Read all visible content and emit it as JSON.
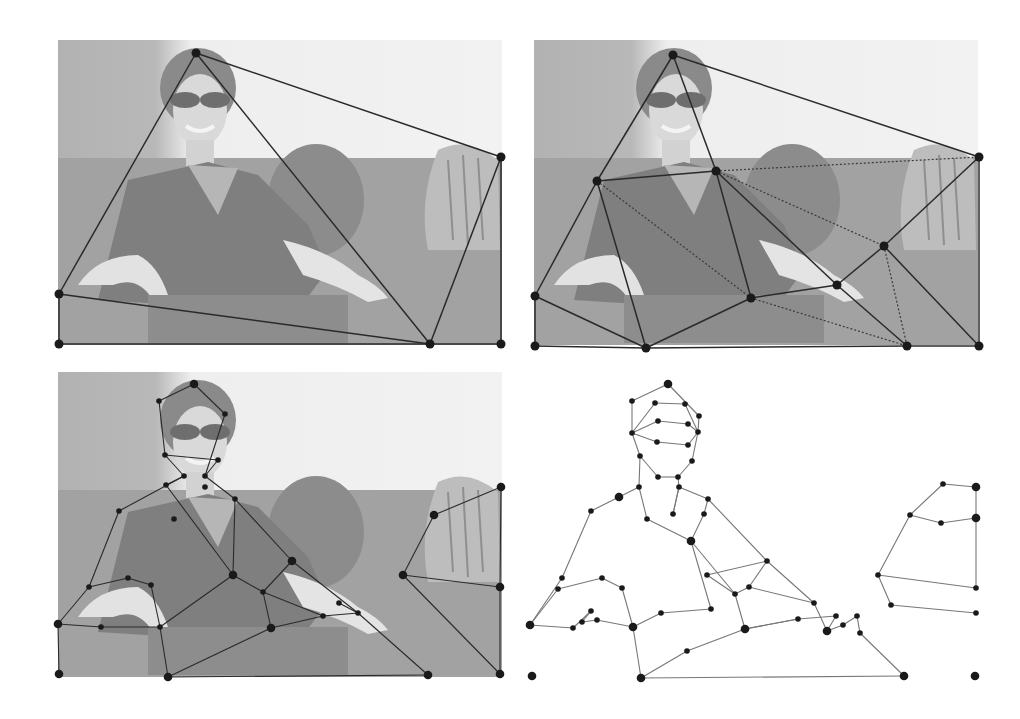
{
  "figure": {
    "colors": {
      "sky": "#efefef",
      "upper_bg": "#b9b9b9",
      "lower_bg": "#9a9a9a",
      "edge": "#2a2a2a",
      "dotted_edge": "#3a3a3a",
      "node": "#1a1a1a",
      "panel4_edge": "#777777"
    },
    "panels": [
      {
        "id": "panel-1",
        "label": "coarse-triangulation",
        "bbox": [
          58,
          40,
          502,
          345
        ],
        "nodes": [
          [
            196,
            53
          ],
          [
            501,
            157
          ],
          [
            59,
            294
          ],
          [
            59,
            344
          ],
          [
            430,
            344
          ],
          [
            501,
            344
          ]
        ],
        "edges": [
          [
            0,
            1
          ],
          [
            0,
            2
          ],
          [
            0,
            4
          ],
          [
            1,
            4
          ],
          [
            2,
            4
          ],
          [
            1,
            5
          ],
          [
            2,
            3
          ],
          [
            3,
            4
          ],
          [
            4,
            5
          ]
        ],
        "dotted_edges": []
      },
      {
        "id": "panel-2",
        "label": "refined-triangulation",
        "bbox": [
          534,
          40,
          980,
          346
        ],
        "nodes": [
          [
            673,
            55
          ],
          [
            979,
            157
          ],
          [
            597,
            181
          ],
          [
            716,
            171
          ],
          [
            535,
            296
          ],
          [
            535,
            346
          ],
          [
            646,
            348
          ],
          [
            751,
            298
          ],
          [
            837,
            285
          ],
          [
            884,
            246
          ],
          [
            907,
            346
          ],
          [
            979,
            346
          ]
        ],
        "edges": [
          [
            0,
            1
          ],
          [
            0,
            2
          ],
          [
            0,
            3
          ],
          [
            2,
            3
          ],
          [
            2,
            4
          ],
          [
            2,
            6
          ],
          [
            3,
            7
          ],
          [
            3,
            8
          ],
          [
            4,
            6
          ],
          [
            4,
            5
          ],
          [
            5,
            6
          ],
          [
            6,
            7
          ],
          [
            7,
            8
          ],
          [
            8,
            9
          ],
          [
            9,
            1
          ],
          [
            8,
            10
          ],
          [
            9,
            11
          ],
          [
            1,
            11
          ],
          [
            6,
            10
          ],
          [
            10,
            11
          ]
        ],
        "dotted_edges": [
          [
            3,
            1
          ],
          [
            2,
            7
          ],
          [
            3,
            9
          ],
          [
            7,
            10
          ],
          [
            9,
            10
          ]
        ]
      },
      {
        "id": "panel-3",
        "label": "contour-mesh-on-image",
        "bbox": [
          58,
          372,
          502,
          676
        ],
        "nodes": [
          [
            194,
            384
          ],
          [
            159,
            401
          ],
          [
            225,
            414
          ],
          [
            165,
            455
          ],
          [
            218,
            460
          ],
          [
            184,
            476
          ],
          [
            205,
            476
          ],
          [
            166,
            485
          ],
          [
            205,
            487
          ],
          [
            235,
            499
          ],
          [
            119,
            511
          ],
          [
            174,
            519
          ],
          [
            292,
            561
          ],
          [
            233,
            575
          ],
          [
            263,
            592
          ],
          [
            89,
            587
          ],
          [
            128,
            578
          ],
          [
            151,
            585
          ],
          [
            58,
            624
          ],
          [
            101,
            627
          ],
          [
            160,
            627
          ],
          [
            271,
            628
          ],
          [
            323,
            616
          ],
          [
            339,
            603
          ],
          [
            358,
            613
          ],
          [
            59,
            674
          ],
          [
            168,
            677
          ],
          [
            428,
            675
          ],
          [
            501,
            487
          ],
          [
            434,
            515
          ],
          [
            403,
            575
          ],
          [
            500,
            587
          ],
          [
            500,
            674
          ]
        ],
        "edges": [
          [
            0,
            1
          ],
          [
            0,
            2
          ],
          [
            1,
            3
          ],
          [
            2,
            6
          ],
          [
            3,
            4
          ],
          [
            4,
            6
          ],
          [
            3,
            5
          ],
          [
            5,
            7
          ],
          [
            5,
            10
          ],
          [
            6,
            9
          ],
          [
            7,
            13
          ],
          [
            9,
            13
          ],
          [
            9,
            12
          ],
          [
            10,
            15
          ],
          [
            15,
            18
          ],
          [
            12,
            24
          ],
          [
            13,
            14
          ],
          [
            14,
            22
          ],
          [
            13,
            20
          ],
          [
            16,
            17
          ],
          [
            15,
            16
          ],
          [
            17,
            20
          ],
          [
            18,
            19
          ],
          [
            19,
            20
          ],
          [
            20,
            26
          ],
          [
            21,
            22
          ],
          [
            14,
            21
          ],
          [
            12,
            14
          ],
          [
            22,
            24
          ],
          [
            23,
            24
          ],
          [
            21,
            26
          ],
          [
            24,
            27
          ],
          [
            26,
            27
          ],
          [
            28,
            29
          ],
          [
            29,
            30
          ],
          [
            30,
            31
          ],
          [
            28,
            31
          ],
          [
            31,
            32
          ],
          [
            30,
            32
          ],
          [
            18,
            25
          ]
        ],
        "dotted_edges": []
      },
      {
        "id": "panel-4",
        "label": "extracted-contour-graph",
        "bbox": [
          525,
          372,
          985,
          680
        ],
        "nodes": [
          [
            668,
            384
          ],
          [
            632,
            401
          ],
          [
            655,
            403
          ],
          [
            685,
            404
          ],
          [
            699,
            416
          ],
          [
            632,
            433
          ],
          [
            658,
            421
          ],
          [
            688,
            424
          ],
          [
            698,
            432
          ],
          [
            657,
            442
          ],
          [
            688,
            445
          ],
          [
            640,
            456
          ],
          [
            692,
            461
          ],
          [
            658,
            477
          ],
          [
            678,
            477
          ],
          [
            639,
            487
          ],
          [
            679,
            487
          ],
          [
            619,
            497
          ],
          [
            591,
            511
          ],
          [
            708,
            499
          ],
          [
            704,
            514
          ],
          [
            647,
            519
          ],
          [
            673,
            514
          ],
          [
            691,
            541
          ],
          [
            767,
            561
          ],
          [
            707,
            575
          ],
          [
            735,
            594
          ],
          [
            749,
            587
          ],
          [
            562,
            578
          ],
          [
            558,
            589
          ],
          [
            602,
            578
          ],
          [
            622,
            588
          ],
          [
            591,
            611
          ],
          [
            582,
            622
          ],
          [
            597,
            620
          ],
          [
            530,
            625
          ],
          [
            573,
            628
          ],
          [
            633,
            627
          ],
          [
            661,
            613
          ],
          [
            711,
            609
          ],
          [
            745,
            629
          ],
          [
            798,
            619
          ],
          [
            814,
            603
          ],
          [
            836,
            616
          ],
          [
            827,
            631
          ],
          [
            843,
            625
          ],
          [
            857,
            616
          ],
          [
            860,
            633
          ],
          [
            687,
            651
          ],
          [
            641,
            678
          ],
          [
            904,
            676
          ],
          [
            532,
            676
          ],
          [
            975,
            676
          ],
          [
            943,
            484
          ],
          [
            976,
            487
          ],
          [
            910,
            515
          ],
          [
            941,
            523
          ],
          [
            976,
            518
          ],
          [
            878,
            575
          ],
          [
            976,
            588
          ],
          [
            891,
            605
          ],
          [
            976,
            613
          ]
        ],
        "edges": [
          [
            0,
            1
          ],
          [
            0,
            4
          ],
          [
            1,
            5
          ],
          [
            4,
            8
          ],
          [
            2,
            3
          ],
          [
            2,
            5
          ],
          [
            3,
            8
          ],
          [
            6,
            7
          ],
          [
            6,
            5
          ],
          [
            7,
            8
          ],
          [
            5,
            9
          ],
          [
            9,
            10
          ],
          [
            10,
            8
          ],
          [
            5,
            11
          ],
          [
            8,
            12
          ],
          [
            11,
            13
          ],
          [
            12,
            14
          ],
          [
            13,
            14
          ],
          [
            11,
            15
          ],
          [
            14,
            16
          ],
          [
            15,
            17
          ],
          [
            17,
            18
          ],
          [
            15,
            21
          ],
          [
            16,
            19
          ],
          [
            16,
            22
          ],
          [
            19,
            20
          ],
          [
            19,
            24
          ],
          [
            20,
            23
          ],
          [
            21,
            23
          ],
          [
            22,
            16
          ],
          [
            23,
            26
          ],
          [
            24,
            25
          ],
          [
            25,
            26
          ],
          [
            26,
            27
          ],
          [
            27,
            24
          ],
          [
            18,
            28
          ],
          [
            28,
            35
          ],
          [
            29,
            35
          ],
          [
            29,
            30
          ],
          [
            30,
            31
          ],
          [
            31,
            37
          ],
          [
            35,
            36
          ],
          [
            36,
            32
          ],
          [
            32,
            33
          ],
          [
            33,
            34
          ],
          [
            34,
            37
          ],
          [
            37,
            49
          ],
          [
            37,
            38
          ],
          [
            38,
            39
          ],
          [
            39,
            23
          ],
          [
            26,
            40
          ],
          [
            40,
            41
          ],
          [
            27,
            42
          ],
          [
            42,
            44
          ],
          [
            41,
            43
          ],
          [
            43,
            44
          ],
          [
            44,
            45
          ],
          [
            45,
            46
          ],
          [
            46,
            47
          ],
          [
            47,
            50
          ],
          [
            40,
            41
          ],
          [
            48,
            49
          ],
          [
            48,
            40
          ],
          [
            49,
            50
          ],
          [
            24,
            42
          ],
          [
            52,
            52
          ],
          [
            53,
            54
          ],
          [
            53,
            55
          ],
          [
            55,
            56
          ],
          [
            56,
            57
          ],
          [
            54,
            57
          ],
          [
            55,
            58
          ],
          [
            57,
            59
          ],
          [
            58,
            59
          ],
          [
            58,
            60
          ],
          [
            60,
            61
          ]
        ],
        "dotted_edges": []
      }
    ]
  }
}
